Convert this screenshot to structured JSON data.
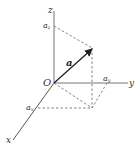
{
  "diagram": {
    "type": "3d-vector-components",
    "labels": {
      "z_axis": "z",
      "y_axis": "y",
      "x_axis": "x",
      "origin": "O",
      "vector": "a",
      "az": "a",
      "az_sub": "z",
      "ay": "a",
      "ay_sub": "y",
      "ax": "a",
      "ax_sub": "x"
    },
    "colors": {
      "axis": "#666666",
      "vector": "#222222",
      "dashed": "#555555",
      "text": "#333333"
    }
  }
}
